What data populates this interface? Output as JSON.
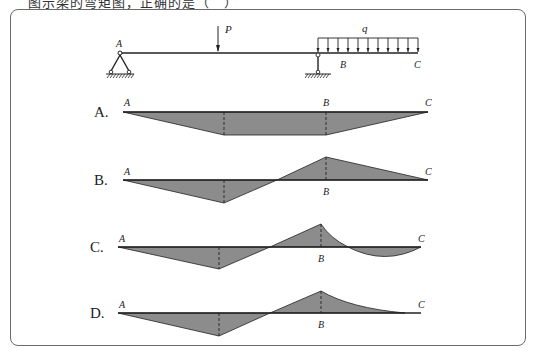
{
  "header": {
    "question_text": "图示梁的弯矩图，正确的是（　）"
  },
  "beam": {
    "point_labels": {
      "A": "A",
      "B": "B",
      "C": "C"
    },
    "load_labels": {
      "point_load": "P",
      "distributed_load": "q"
    },
    "supports": [
      "pin-support-at-A",
      "roller-link-support-at-B"
    ]
  },
  "options": [
    {
      "label": "A.",
      "pointA": "A",
      "pointB": "B",
      "pointC": "C"
    },
    {
      "label": "B.",
      "pointA": "A",
      "pointB": "B",
      "pointC": "C"
    },
    {
      "label": "C.",
      "pointA": "A",
      "pointB": "B",
      "pointC": "C"
    },
    {
      "label": "D.",
      "pointA": "A",
      "pointB": "B",
      "pointC": "C"
    }
  ],
  "colors": {
    "fill": "#8c8c8c",
    "line": "#222222",
    "frame": "#6a6a6a"
  }
}
